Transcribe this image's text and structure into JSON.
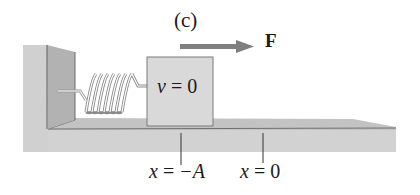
{
  "figure": {
    "panel_label": "(c)",
    "force": {
      "label": "F",
      "arrow_color": "#7f7f7f"
    },
    "block": {
      "velocity_var": "v",
      "velocity_eq": " = ",
      "velocity_value": "0",
      "fill": "#d9d9d9"
    },
    "positions": [
      {
        "var": "x",
        "eq": " = ",
        "value": "−A"
      },
      {
        "var": "x",
        "eq": " = ",
        "value": "0"
      }
    ],
    "colors": {
      "wall_face": "#c4c4c4",
      "wall_side": "#a8a8a8",
      "floor_top": "#c8c8c8",
      "floor_front": "#cfcfcf",
      "edge": "#6a6a6a",
      "spring": "#8a8a8a"
    }
  }
}
